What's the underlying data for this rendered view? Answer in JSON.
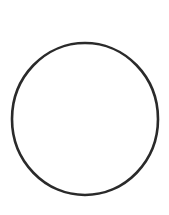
{
  "canvas": {
    "width": 169,
    "height": 215,
    "background_color": "#ffffff",
    "title": "Circle outline",
    "content_description": "A single empty circle outline drawn in dark ink on a blank white background"
  },
  "shapes": [
    {
      "id": "circle-outline",
      "type": "ellipse",
      "label": "circle-outline",
      "center_x": 85,
      "center_y": 119,
      "radius_x": 73,
      "radius_y": 76,
      "stroke_color": "#2b2b2b",
      "stroke_width": 2.6,
      "fill": "none",
      "bounds": {
        "left": 12,
        "top": 43,
        "right": 158,
        "bottom": 195
      }
    }
  ],
  "interior": {
    "fill_color": "#ffffff",
    "contents": ""
  }
}
